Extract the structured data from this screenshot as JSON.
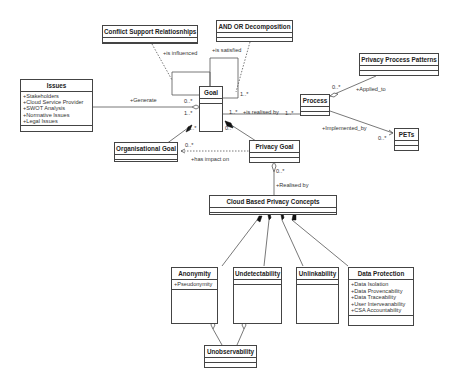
{
  "classes": {
    "conflict": {
      "title": "Conflict Support Relatiosnhips",
      "attrs": []
    },
    "andor": {
      "title": "AND OR Decomposition",
      "attrs": []
    },
    "ppp": {
      "title": "Privacy Process Patterns",
      "attrs": []
    },
    "issues": {
      "title": "Issues",
      "attrs": [
        "+Stakeholders",
        "+Cloud Service Provider",
        "+SWOT Analysis",
        "+Normative Issues",
        "+Legal Issues"
      ]
    },
    "goal": {
      "title": "Goal",
      "attrs": []
    },
    "process": {
      "title": "Process",
      "attrs": []
    },
    "pets": {
      "title": "PETs",
      "attrs": []
    },
    "orggoal": {
      "title": "Organisational Goal",
      "attrs": []
    },
    "privgoal": {
      "title": "Privacy Goal",
      "attrs": []
    },
    "cbpc": {
      "title": "Cloud Based Privacy Concepts",
      "attrs": []
    },
    "anonymity": {
      "title": "Anonymity",
      "attrs": [
        "+Pseudonymity"
      ]
    },
    "undetect": {
      "title": "Undetectability",
      "attrs": []
    },
    "unlink": {
      "title": "Unlinkability",
      "attrs": []
    },
    "dataprot": {
      "title": "Data Protection",
      "attrs": [
        "+Data Isolation",
        "+Data Provencability",
        "+Data Traceability",
        "+User Interveanability",
        "+CSA Accountability"
      ]
    },
    "unobs": {
      "title": "Unobservability",
      "attrs": []
    }
  },
  "labels": {
    "is_influenced": "+is influenced",
    "is_satisfied": "+is satisfied",
    "generate": "+Generate",
    "is_realised_by": "+is realised by",
    "applied_to": "+Applied_to",
    "implemented_by": "+Implemented_by",
    "has_impact_on": "+has impact on",
    "realised_by": "+Realised by"
  },
  "multiplicities": {
    "goal_generate": "0..*",
    "goal_issue_left": "1..*",
    "goal_org": "1..*",
    "goal_priv": "0..*",
    "goal_satisfied": "1..*",
    "goal_realised": "1..*",
    "process_realised": "1..*",
    "process_applied": "0..*",
    "pets_impl": "0..*",
    "org_impact": "0..*",
    "priv_realised": "0..*"
  }
}
